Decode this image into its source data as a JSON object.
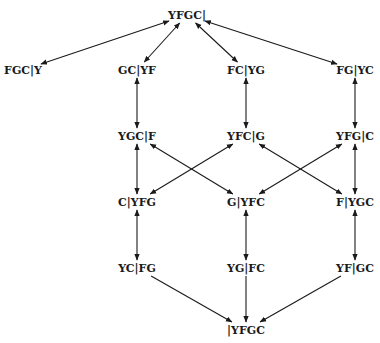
{
  "diagram": {
    "type": "state-transition-graph",
    "edge_color": "#1a1a1a",
    "nodes": [
      {
        "id": "n0",
        "label": "YFGC|",
        "x": 187,
        "y": 15
      },
      {
        "id": "n1",
        "label": "FGC|Y",
        "x": 23,
        "y": 70
      },
      {
        "id": "n2",
        "label": "GC|YF",
        "x": 137,
        "y": 70
      },
      {
        "id": "n3",
        "label": "FC|YG",
        "x": 246,
        "y": 70
      },
      {
        "id": "n4",
        "label": "FG|YC",
        "x": 355,
        "y": 70
      },
      {
        "id": "n5",
        "label": "YGC|F",
        "x": 137,
        "y": 136
      },
      {
        "id": "n6",
        "label": "YFC|G",
        "x": 246,
        "y": 136
      },
      {
        "id": "n7",
        "label": "YFG|C",
        "x": 355,
        "y": 136
      },
      {
        "id": "n8",
        "label": "C|YFG",
        "x": 137,
        "y": 202
      },
      {
        "id": "n9",
        "label": "G|YFC",
        "x": 246,
        "y": 202
      },
      {
        "id": "n10",
        "label": "F|YGC",
        "x": 355,
        "y": 202
      },
      {
        "id": "n11",
        "label": "YC|FG",
        "x": 137,
        "y": 268
      },
      {
        "id": "n12",
        "label": "YG|FC",
        "x": 246,
        "y": 268
      },
      {
        "id": "n13",
        "label": "YF|GC",
        "x": 355,
        "y": 268
      },
      {
        "id": "n14",
        "label": "|YFGC",
        "x": 246,
        "y": 330
      }
    ],
    "edges": [
      {
        "from": "n0",
        "to": "n1",
        "bidirectional": true
      },
      {
        "from": "n0",
        "to": "n2",
        "bidirectional": true
      },
      {
        "from": "n0",
        "to": "n3",
        "bidirectional": true
      },
      {
        "from": "n0",
        "to": "n4",
        "bidirectional": true
      },
      {
        "from": "n2",
        "to": "n5",
        "bidirectional": true
      },
      {
        "from": "n3",
        "to": "n6",
        "bidirectional": true
      },
      {
        "from": "n4",
        "to": "n7",
        "bidirectional": true
      },
      {
        "from": "n5",
        "to": "n8",
        "bidirectional": true
      },
      {
        "from": "n5",
        "to": "n9",
        "bidirectional": true
      },
      {
        "from": "n6",
        "to": "n8",
        "bidirectional": true
      },
      {
        "from": "n6",
        "to": "n10",
        "bidirectional": true
      },
      {
        "from": "n7",
        "to": "n9",
        "bidirectional": true
      },
      {
        "from": "n7",
        "to": "n10",
        "bidirectional": true
      },
      {
        "from": "n8",
        "to": "n11",
        "bidirectional": true
      },
      {
        "from": "n9",
        "to": "n12",
        "bidirectional": true
      },
      {
        "from": "n10",
        "to": "n13",
        "bidirectional": true
      },
      {
        "from": "n11",
        "to": "n14",
        "bidirectional": false
      },
      {
        "from": "n12",
        "to": "n14",
        "bidirectional": false
      },
      {
        "from": "n13",
        "to": "n14",
        "bidirectional": false
      }
    ]
  }
}
